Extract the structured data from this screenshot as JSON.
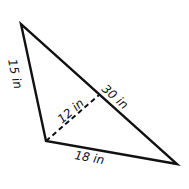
{
  "diagram": {
    "type": "triangle-with-altitude",
    "colors": {
      "stroke": "#111111",
      "background": "#ffffff"
    },
    "vertices": {
      "top": [
        21,
        24
      ],
      "left": [
        46,
        141
      ],
      "right": [
        177,
        164
      ]
    },
    "altitude_foot": [
      99,
      95
    ],
    "labels": {
      "side_left": "15 in",
      "hypotenuse": "30 in",
      "altitude": "12 in",
      "side_bottom": "18 in"
    }
  }
}
